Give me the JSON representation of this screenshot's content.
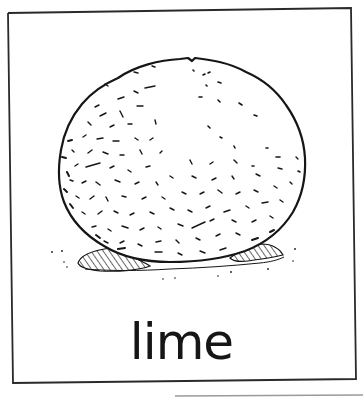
{
  "card": {
    "word": "lime",
    "illustration": "lime-fruit-drawing",
    "border_color": "#2a2a2a",
    "ink_color": "#161616",
    "background": "#ffffff"
  }
}
